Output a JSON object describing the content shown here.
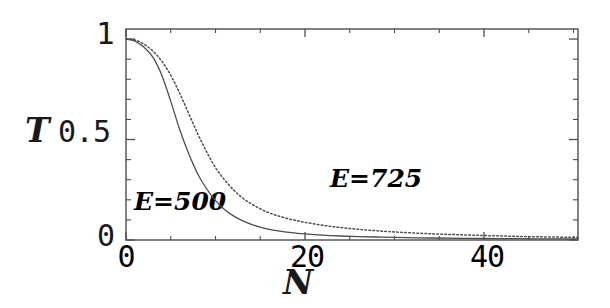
{
  "chart_data": {
    "type": "line",
    "title": "",
    "subtitle": "",
    "xlabel": "N",
    "ylabel": "T",
    "xlim": [
      0,
      50.5
    ],
    "ylim": [
      0,
      1.05
    ],
    "grid": false,
    "legend_position": "inline-annotations",
    "x_ticks_major": [
      0,
      20,
      40
    ],
    "x_tick_labels": [
      "0",
      "20",
      "40"
    ],
    "x_ticks_minor": [
      5,
      10,
      15,
      25,
      30,
      35,
      45,
      50
    ],
    "y_ticks_major": [
      0,
      0.5,
      1
    ],
    "y_tick_labels": [
      "0",
      "0.5",
      "1"
    ],
    "y_ticks_minor": [
      0.1,
      0.2,
      0.3,
      0.4,
      0.6,
      0.7,
      0.8,
      0.9
    ],
    "frame_color": "#4d4d4d",
    "series": [
      {
        "name": "E=500",
        "label": "E=500",
        "style": "solid",
        "color": "#4d4d4d",
        "annotation_x": 3.0,
        "annotation_y": 0.21,
        "x": [
          0,
          1,
          2,
          3,
          4,
          5,
          6,
          7,
          8,
          9,
          10,
          11,
          12,
          13,
          14,
          15,
          16,
          17,
          18,
          19,
          20,
          22,
          24,
          26,
          28,
          30,
          34,
          38,
          42,
          46,
          50.5
        ],
        "y": [
          1.0,
          0.99,
          0.96,
          0.91,
          0.82,
          0.69,
          0.55,
          0.43,
          0.33,
          0.255,
          0.196,
          0.152,
          0.12,
          0.096,
          0.078,
          0.064,
          0.053,
          0.045,
          0.039,
          0.034,
          0.03,
          0.024,
          0.02,
          0.017,
          0.015,
          0.013,
          0.01,
          0.008,
          0.007,
          0.006,
          0.005
        ]
      },
      {
        "name": "E=725",
        "label": "E=725",
        "style": "dotted",
        "color": "#4d4d4d",
        "annotation_x": 22.8,
        "annotation_y": 0.34,
        "x": [
          0,
          1,
          2,
          3,
          4,
          5,
          6,
          7,
          8,
          9,
          10,
          11,
          12,
          13,
          14,
          15,
          16,
          17,
          18,
          19,
          20,
          22,
          24,
          26,
          28,
          30,
          34,
          38,
          42,
          46,
          50.5
        ],
        "y": [
          1.0,
          0.995,
          0.975,
          0.94,
          0.89,
          0.82,
          0.73,
          0.63,
          0.53,
          0.44,
          0.36,
          0.3,
          0.25,
          0.21,
          0.18,
          0.155,
          0.135,
          0.12,
          0.107,
          0.097,
          0.088,
          0.073,
          0.062,
          0.053,
          0.046,
          0.04,
          0.031,
          0.025,
          0.02,
          0.016,
          0.013
        ]
      }
    ]
  },
  "axis": {
    "y_title": "T",
    "x_title": "N",
    "y_label_top": "1",
    "y_label_mid": "0.5",
    "y_label_bottom": "0",
    "x_label_0": "0",
    "x_label_20": "20",
    "x_label_40": "40"
  },
  "annotations": {
    "solid_curve": "E=500",
    "dotted_curve": "E=725"
  }
}
